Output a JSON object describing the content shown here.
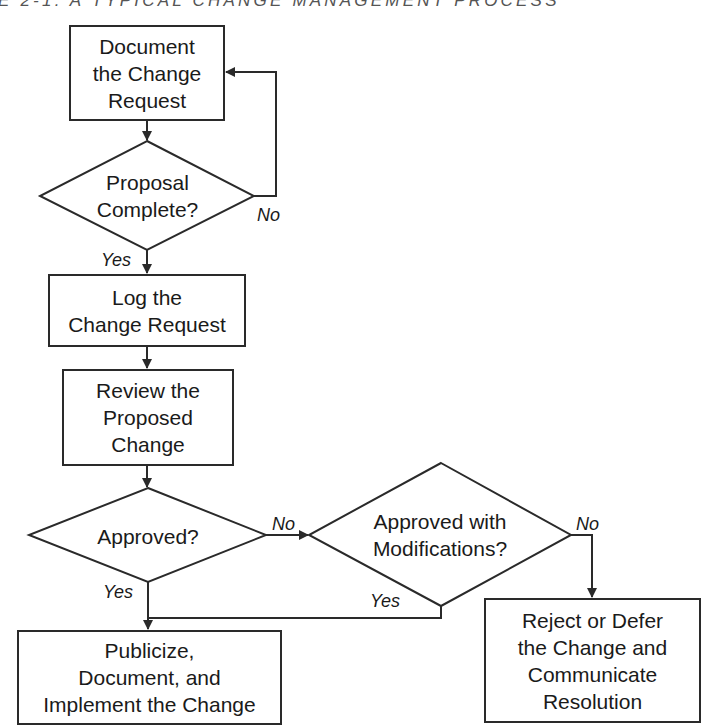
{
  "title": "E 2-1: A TYPICAL CHANGE MANAGEMENT PROCESS",
  "nodes": {
    "document_request": {
      "type": "process",
      "lines": [
        "Document",
        "the Change",
        "Request"
      ]
    },
    "proposal_complete": {
      "type": "decision",
      "lines": [
        "Proposal",
        "Complete?"
      ]
    },
    "log_request": {
      "type": "process",
      "lines": [
        "Log the",
        "Change Request"
      ]
    },
    "review_change": {
      "type": "process",
      "lines": [
        "Review the",
        "Proposed",
        "Change"
      ]
    },
    "approved": {
      "type": "decision",
      "lines": [
        "Approved?"
      ]
    },
    "approved_with_mods": {
      "type": "decision",
      "lines": [
        "Approved with",
        "Modifications?"
      ]
    },
    "reject_defer": {
      "type": "process",
      "lines": [
        "Reject or Defer",
        "the Change and",
        "Communicate",
        "Resolution"
      ]
    },
    "publicize": {
      "type": "process",
      "lines": [
        "Publicize,",
        "Document, and",
        "Implement the Change"
      ]
    }
  },
  "edge_labels": {
    "proposal_no": "No",
    "proposal_yes": "Yes",
    "approved_no": "No",
    "approved_yes": "Yes",
    "mods_no": "No",
    "mods_yes": "Yes"
  },
  "colors": {
    "stroke": "#2a2a2a",
    "background": "#ffffff",
    "title": "#555555"
  }
}
